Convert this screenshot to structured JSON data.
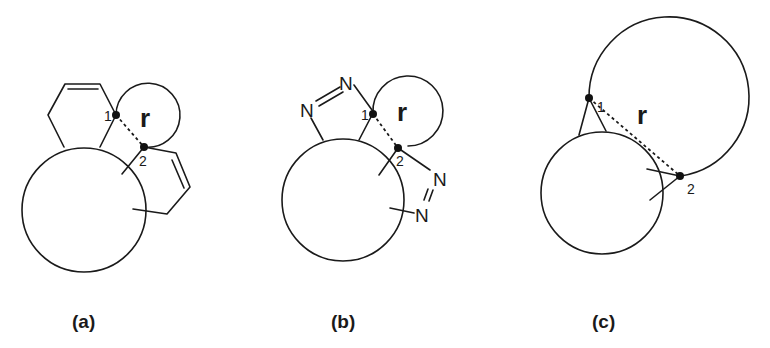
{
  "figure": {
    "panels": [
      {
        "id": "a",
        "label": "(a)",
        "point_labels": [
          "1",
          "2"
        ],
        "distance_label": "r",
        "description": "Two cyclohexene rings fused to a large macrocycle with a small ring closure spanning atoms 1 and 2"
      },
      {
        "id": "b",
        "label": "(b)",
        "point_labels": [
          "1",
          "2"
        ],
        "distance_label": "r",
        "atom_labels": [
          "N",
          "N",
          "N",
          "N"
        ],
        "description": "Two diazene-containing rings fused to a large macrocycle with a small ring closure spanning atoms 1 and 2"
      },
      {
        "id": "c",
        "label": "(c)",
        "point_labels": [
          "1",
          "2"
        ],
        "distance_label": "r",
        "description": "Large ring closure spanning atoms 1 and 2 attached to a smaller macrocycle"
      }
    ]
  }
}
